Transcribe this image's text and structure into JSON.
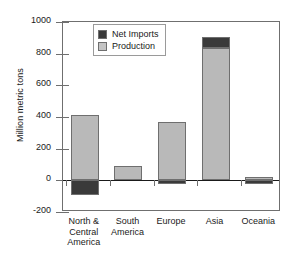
{
  "chart_data": {
    "type": "bar",
    "title": "",
    "subtitle": "",
    "xlabel": "",
    "ylabel": "Million metric tons",
    "ylim": [
      -200,
      1000
    ],
    "yticks": [
      1000,
      800,
      600,
      400,
      200,
      0,
      -200
    ],
    "ytick_labels": [
      "1000",
      "800",
      "600",
      "400",
      "200",
      "0",
      "-200"
    ],
    "grid": false,
    "stacked": true,
    "legend_position": "upper left inside",
    "categories": [
      "North &\nCentral\nAmerica",
      "South\nAmerica",
      "Europe",
      "Asia",
      "Oceania"
    ],
    "series": [
      {
        "name": "Production",
        "color": "#b9b9b9",
        "values": [
          415,
          90,
          370,
          835,
          22
        ]
      },
      {
        "name": "Net Imports",
        "color": "#3a3a3a",
        "values": [
          -90,
          0,
          -25,
          70,
          -25
        ]
      }
    ]
  },
  "legend": {
    "entries": [
      {
        "label": "Net Imports",
        "color": "#3a3a3a"
      },
      {
        "label": "Production",
        "color": "#c4c4c4"
      }
    ]
  },
  "axis": {
    "y_title": "Million metric tons",
    "y_tick_labels": [
      "1000",
      "800",
      "600",
      "400",
      "200",
      "0",
      "-200"
    ],
    "x_tick_labels": [
      "North &\nCentral\nAmerica",
      "South\nAmerica",
      "Europe",
      "Asia",
      "Oceania"
    ]
  },
  "colors": {
    "net_imports": "#3a3a3a",
    "production": "#b9b9b9",
    "frame": "#6f6f6f",
    "text": "#1a1a1a",
    "background": "#ffffff"
  }
}
